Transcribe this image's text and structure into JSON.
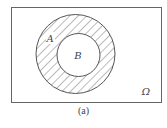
{
  "diagram": {
    "type": "venn",
    "universe_label": "Ω",
    "sets": [
      {
        "label": "A",
        "shaded": true
      },
      {
        "label": "B",
        "shaded": false
      }
    ],
    "relation": "B ⊂ A",
    "shaded_region": "A \\ B",
    "caption": "(a)"
  },
  "colors": {
    "line": "#555555",
    "background": "#ffffff"
  }
}
